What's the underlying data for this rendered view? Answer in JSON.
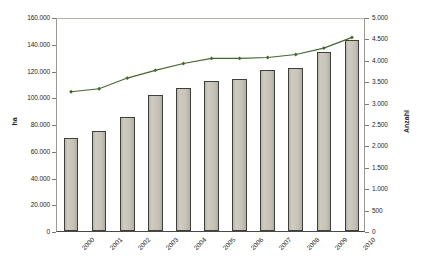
{
  "chart_data": {
    "type": "bar",
    "title": "",
    "subtitle": "",
    "xlabel": "",
    "ylabel": "ha",
    "y2label": "Anzahl",
    "grid": false,
    "legend": "none",
    "categories": [
      "2000",
      "2001",
      "2002",
      "2003",
      "2004",
      "2005",
      "2006",
      "2007",
      "2008",
      "2009",
      "2010"
    ],
    "ylim": [
      0,
      160000
    ],
    "y2lim": [
      0,
      5000
    ],
    "yticks": [
      "0",
      "20.000",
      "40.000",
      "60.000",
      "80.000",
      "100.000",
      "120.000",
      "140.000",
      "160.000"
    ],
    "ytick_values": [
      0,
      20000,
      40000,
      60000,
      80000,
      100000,
      120000,
      140000,
      160000
    ],
    "y2ticks": [
      "0",
      "500",
      "1.000",
      "1.500",
      "2.000",
      "2.500",
      "3.000",
      "3.500",
      "4.000",
      "4.500",
      "5.000"
    ],
    "y2tick_values": [
      0,
      500,
      1000,
      1500,
      2000,
      2500,
      3000,
      3500,
      4000,
      4500,
      5000
    ],
    "series": [
      {
        "name": "Fläche",
        "type": "bar",
        "axis": "left",
        "unit": "ha",
        "color": "#c6c2b8",
        "edge_color": "#3f3f3b",
        "values": [
          69500,
          74500,
          85000,
          101500,
          107000,
          112500,
          114000,
          120500,
          122000,
          134000,
          143000
        ]
      },
      {
        "name": "Betriebe",
        "type": "line",
        "axis": "right",
        "unit": "Anzahl",
        "color": "#46662f",
        "marker": "diamond",
        "values": [
          3300,
          3370,
          3620,
          3800,
          3960,
          4080,
          4080,
          4100,
          4170,
          4320,
          4570
        ]
      }
    ]
  }
}
